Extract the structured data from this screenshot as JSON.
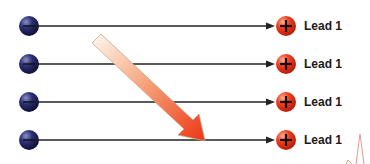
{
  "diagram": {
    "rows": [
      {
        "negative_label": "−",
        "positive_label": "+",
        "lead_label": "Lead 1",
        "y": 26
      },
      {
        "negative_label": "−",
        "positive_label": "+",
        "lead_label": "Lead 1",
        "y": 64
      },
      {
        "negative_label": "−",
        "positive_label": "+",
        "lead_label": "Lead 1",
        "y": 102
      },
      {
        "negative_label": "−",
        "positive_label": "+",
        "lead_label": "Lead 1",
        "y": 140
      }
    ],
    "colors": {
      "negative_electrode": "#1e2156",
      "positive_electrode": "#e8321c",
      "line": "#222222",
      "arrow_start": "#fbe9dc",
      "arrow_end": "#ee3d1a",
      "ecg_trace": "#e89a8a"
    }
  }
}
